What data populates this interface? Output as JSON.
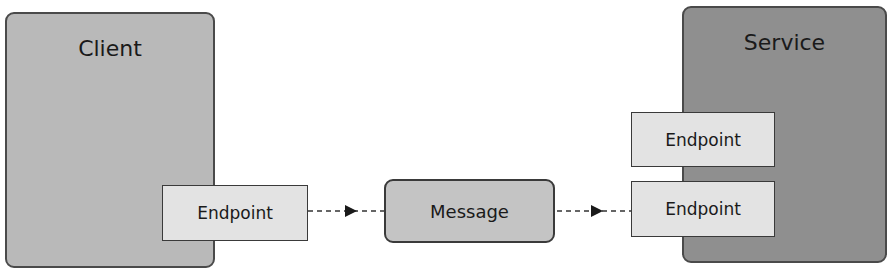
{
  "diagram": {
    "client": {
      "label": "Client",
      "endpoint": "Endpoint"
    },
    "service": {
      "label": "Service",
      "endpoints": [
        "Endpoint",
        "Endpoint"
      ]
    },
    "message": {
      "label": "Message"
    },
    "connectors": [
      {
        "from": "client-endpoint",
        "to": "message",
        "style": "dashed-arrow"
      },
      {
        "from": "message",
        "to": "service-endpoint-2",
        "style": "dashed-arrow"
      }
    ],
    "colors": {
      "client_fill": "#b9b9b9",
      "service_fill": "#8f8f8f",
      "endpoint_fill": "#e3e3e3",
      "message_fill": "#c4c4c4"
    }
  }
}
